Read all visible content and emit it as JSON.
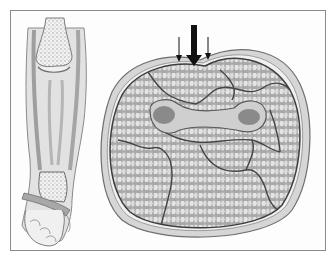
{
  "figure": {
    "type": "anatomical-illustration",
    "panels": [
      {
        "id": "forearm",
        "label": "Forearm with cast, longitudinal view"
      },
      {
        "id": "cross-section",
        "label": "Forearm cross-section with compartment compression"
      }
    ],
    "arrows": [
      {
        "id": "left-thin",
        "weight": "thin",
        "direction": "down"
      },
      {
        "id": "center-thick",
        "weight": "thick",
        "direction": "down"
      },
      {
        "id": "right-thin",
        "weight": "thin",
        "direction": "down"
      }
    ],
    "colors": {
      "frame": "#8c8c8c",
      "skin": "#d9d9d9",
      "skin_outline": "#6e6e6e",
      "muscle_fill": "#bdbdbd",
      "muscle_cells": "#e6e6e6",
      "fascia": "#4a4a4a",
      "bone_cortex": "#c8c8c8",
      "bone_marrow": "#8a8a8a",
      "arrow": "#111111"
    }
  }
}
